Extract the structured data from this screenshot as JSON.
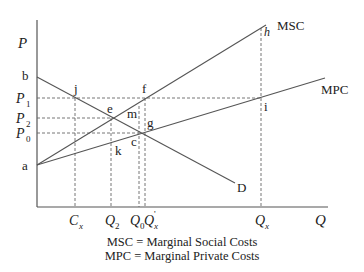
{
  "axes": {
    "y_label": "P",
    "x_label": "Q"
  },
  "curves": {
    "msc": "MSC",
    "mpc": "MPC",
    "demand": "D"
  },
  "points": {
    "a": "a",
    "b": "b",
    "j": "j",
    "e": "e",
    "f": "f",
    "m": "m",
    "g": "g",
    "c": "c",
    "k": "k",
    "h": "h",
    "i": "i"
  },
  "price_ticks": [
    {
      "base": "P",
      "sub": "1"
    },
    {
      "base": "P",
      "sub": "2"
    },
    {
      "base": "P",
      "sub": "0"
    }
  ],
  "quantity_ticks": [
    {
      "base": "C",
      "sub": "x",
      "prime": ""
    },
    {
      "base": "Q",
      "sub": "2",
      "prime": ""
    },
    {
      "base": "Q",
      "sub": "0",
      "prime": ""
    },
    {
      "base": "Q",
      "sub": "x",
      "prime": "'"
    },
    {
      "base": "Q",
      "sub": "x",
      "prime": ""
    }
  ],
  "legend": [
    "MSC = Marginal Social Costs",
    "MPC = Marginal Private Costs"
  ]
}
